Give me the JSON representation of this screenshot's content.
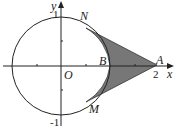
{
  "diagram": {
    "labels": {
      "y": "y",
      "x": "x",
      "N": "N",
      "O": "O",
      "B": "B",
      "A": "A",
      "M": "M"
    },
    "ticks": {
      "y_top": "1",
      "y_bottom": "-1",
      "x_two": "2"
    },
    "colors": {
      "shade": "#777777",
      "line": "#222222"
    }
  }
}
